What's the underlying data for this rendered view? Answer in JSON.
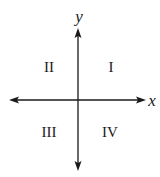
{
  "diagram": {
    "axes": {
      "x_label": "x",
      "y_label": "y"
    },
    "quadrants": [
      {
        "id": "I",
        "label": "I",
        "position": "upper-right"
      },
      {
        "id": "II",
        "label": "II",
        "position": "upper-left"
      },
      {
        "id": "III",
        "label": "III",
        "position": "lower-left"
      },
      {
        "id": "IV",
        "label": "IV",
        "position": "lower-right"
      }
    ],
    "colors": {
      "axis": "#1a1a1a",
      "text": "#1a1a1a",
      "background": "#ffffff"
    }
  }
}
